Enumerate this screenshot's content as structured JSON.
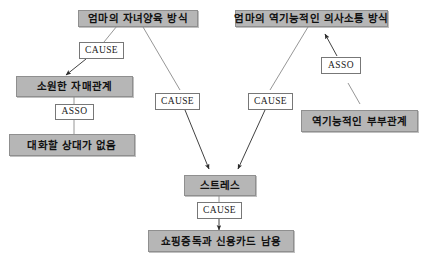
{
  "diagram": {
    "title": "",
    "type": "causal-map",
    "colors": {
      "node_fill": "#b6b6b6",
      "node_border": "#8f8f8f",
      "label_fill": "#ffffff",
      "label_border": "#777777",
      "edge_stroke": "#8a8a8a",
      "background": "#ffffff",
      "text": "#111111"
    },
    "nodes": [
      {
        "id": "n1",
        "label": "엄마의 자녀양육 방식"
      },
      {
        "id": "n2",
        "label": "엄마의 역기능적인 의사소통 방식"
      },
      {
        "id": "n3",
        "label": "소원한 자매관계"
      },
      {
        "id": "n4",
        "label": "대화할 상대가 없음"
      },
      {
        "id": "n5",
        "label": "역기능적인 부부관계"
      },
      {
        "id": "n6",
        "label": "스트레스"
      },
      {
        "id": "n7",
        "label": "쇼핑중독과 신용카드 남용"
      }
    ],
    "edge_labels": [
      {
        "id": "e1",
        "label": "CAUSE",
        "from": "n1",
        "to": "n3"
      },
      {
        "id": "e2",
        "label": "ASSO",
        "from": "n3",
        "to": "n4"
      },
      {
        "id": "e3",
        "label": "CAUSE",
        "from": "n1",
        "to": "n6"
      },
      {
        "id": "e4",
        "label": "CAUSE",
        "from": "n2",
        "to": "n6"
      },
      {
        "id": "e5",
        "label": "ASSO",
        "from": "n5",
        "to": "n2"
      },
      {
        "id": "e6",
        "label": "CAUSE",
        "from": "n6",
        "to": "n7"
      }
    ]
  }
}
